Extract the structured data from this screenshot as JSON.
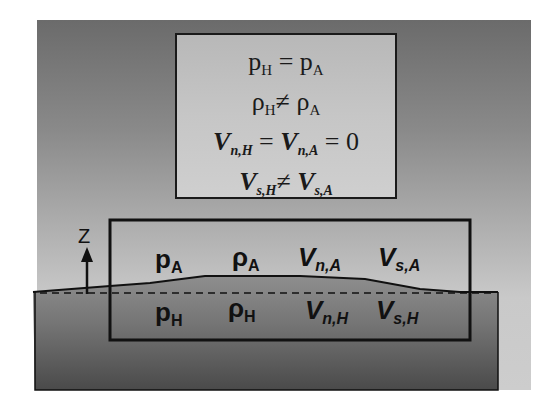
{
  "diagram": {
    "equations": [
      {
        "lhs": {
          "sym": "p",
          "sub": "H"
        },
        "op": "=",
        "rhs": {
          "sym": "p",
          "sub": "A"
        }
      },
      {
        "lhs": {
          "sym": "ρ",
          "sub": "H"
        },
        "op": "≠",
        "rhs": {
          "sym": "ρ",
          "sub": "A"
        }
      },
      {
        "lhs": {
          "sym": "V",
          "sub": "n,H"
        },
        "op": "=",
        "rhs": {
          "sym": "V",
          "sub": "n,A"
        },
        "op2": "=",
        "rhs2": "0"
      },
      {
        "lhs": {
          "sym": "V",
          "sub": "s,H"
        },
        "op": "≠",
        "rhs": {
          "sym": "V",
          "sub": "s,A"
        }
      }
    ],
    "axis": {
      "label": "Z"
    },
    "upper_labels": [
      {
        "sym": "p",
        "sub": "A"
      },
      {
        "sym": "ρ",
        "sub": "A"
      },
      {
        "sym": "V",
        "sub": "n,A"
      },
      {
        "sym": "V",
        "sub": "s,A"
      }
    ],
    "lower_labels": [
      {
        "sym": "p",
        "sub": "H"
      },
      {
        "sym": "ρ",
        "sub": "H"
      },
      {
        "sym": "V",
        "sub": "n,H"
      },
      {
        "sym": "V",
        "sub": "s,H"
      }
    ],
    "colors": {
      "upper_top": "#6b6b6b",
      "upper_bottom": "#cdcdcd",
      "lower_top": "#8e8e8e",
      "lower_bottom": "#4a4a4a",
      "stroke": "#111111"
    }
  }
}
